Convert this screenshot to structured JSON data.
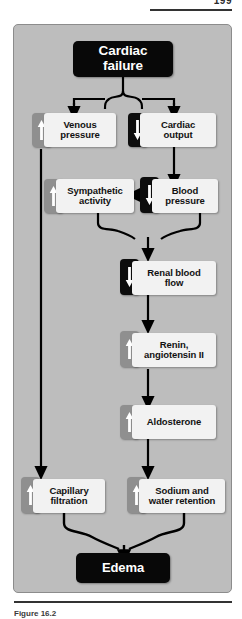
{
  "page": {
    "number": "199",
    "caption": "Figure 16.2"
  },
  "diagram": {
    "nodes": [
      {
        "id": "cardiac-failure",
        "label": "Cardiac failure",
        "line1": "Cardiac",
        "line2": "failure",
        "style": "black",
        "arrow": "none"
      },
      {
        "id": "venous-pressure",
        "label": "Venous pressure",
        "line1": "Venous",
        "line2": "pressure",
        "style": "light",
        "arrow": "up",
        "arrow_color": "#8f8f8f"
      },
      {
        "id": "cardiac-output",
        "label": "Cardiac output",
        "line1": "Cardiac",
        "line2": "output",
        "style": "light",
        "arrow": "down",
        "arrow_color": "#0d0d0d"
      },
      {
        "id": "sympathetic-activity",
        "label": "Sympathetic activity",
        "line1": "Sympathetic",
        "line2": "activity",
        "style": "light",
        "arrow": "up",
        "arrow_color": "#8f8f8f"
      },
      {
        "id": "blood-pressure",
        "label": "Blood pressure",
        "line1": "Blood",
        "line2": "pressure",
        "style": "light",
        "arrow": "down",
        "arrow_color": "#0d0d0d"
      },
      {
        "id": "renal-blood-flow",
        "label": "Renal blood flow",
        "line1": "Renal blood",
        "line2": "flow",
        "style": "light",
        "arrow": "down",
        "arrow_color": "#0d0d0d"
      },
      {
        "id": "renin-angiotensin",
        "label": "Renin, angiotensin II",
        "line1": "Renin,",
        "line2": "angiotensin II",
        "style": "light",
        "arrow": "up",
        "arrow_color": "#8f8f8f"
      },
      {
        "id": "aldosterone",
        "label": "Aldosterone",
        "line1": "Aldosterone",
        "line2": "",
        "style": "light",
        "arrow": "up",
        "arrow_color": "#8f8f8f"
      },
      {
        "id": "capillary-filtration",
        "label": "Capillary filtration",
        "line1": "Capillary",
        "line2": "filtration",
        "style": "light",
        "arrow": "up",
        "arrow_color": "#8f8f8f"
      },
      {
        "id": "sodium-water-retention",
        "label": "Sodium and water retention",
        "line1": "Sodium and",
        "line2": "water retention",
        "style": "light",
        "arrow": "up",
        "arrow_color": "#8f8f8f"
      },
      {
        "id": "edema",
        "label": "Edema",
        "line1": "Edema",
        "line2": "",
        "style": "black",
        "arrow": "none"
      }
    ],
    "edges": [
      {
        "from": "cardiac-failure",
        "to": "venous-pressure"
      },
      {
        "from": "cardiac-failure",
        "to": "cardiac-output"
      },
      {
        "from": "cardiac-output",
        "to": "blood-pressure"
      },
      {
        "from": "blood-pressure",
        "to": "sympathetic-activity"
      },
      {
        "from": "sympathetic-activity",
        "to": "renal-blood-flow"
      },
      {
        "from": "blood-pressure",
        "to": "renal-blood-flow"
      },
      {
        "from": "renal-blood-flow",
        "to": "renin-angiotensin"
      },
      {
        "from": "renin-angiotensin",
        "to": "aldosterone"
      },
      {
        "from": "aldosterone",
        "to": "sodium-water-retention"
      },
      {
        "from": "venous-pressure",
        "to": "capillary-filtration"
      },
      {
        "from": "capillary-filtration",
        "to": "edema"
      },
      {
        "from": "sodium-water-retention",
        "to": "edema"
      }
    ],
    "colors": {
      "panel_background": "#bdbdbd",
      "panel_border": "#8c8c8c",
      "black_node": "#080808",
      "light_node": "#f2f2f2",
      "increase_badge": "#8f8f8f",
      "decrease_badge": "#0d0d0d",
      "connector": "#000000",
      "text_dark": "#111111",
      "text_light": "#ffffff"
    }
  }
}
